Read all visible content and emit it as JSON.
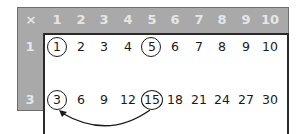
{
  "table": {
    "corner_label": "×",
    "column_headers": [
      "1",
      "2",
      "3",
      "4",
      "5",
      "6",
      "7",
      "8",
      "9",
      "10"
    ],
    "rows": [
      {
        "header": "1",
        "values": [
          "1",
          "2",
          "3",
          "4",
          "5",
          "6",
          "7",
          "8",
          "9",
          "10"
        ]
      },
      {
        "header": "3",
        "values": [
          "3",
          "6",
          "9",
          "12",
          "15",
          "18",
          "21",
          "24",
          "27",
          "30"
        ]
      }
    ],
    "circled_cells": [
      {
        "row": 0,
        "col": 0,
        "value": "1"
      },
      {
        "row": 0,
        "col": 4,
        "value": "5"
      },
      {
        "row": 1,
        "col": 0,
        "value": "3"
      },
      {
        "row": 1,
        "col": 4,
        "value": "15"
      }
    ],
    "arrow": {
      "from": "15",
      "to": "3",
      "direction": "right-to-left curved"
    }
  },
  "colors": {
    "header_bg": "#a9a9a9",
    "header_text": "#e6e6e6",
    "border": "#2a2a2a",
    "text": "#1a1a1a"
  }
}
